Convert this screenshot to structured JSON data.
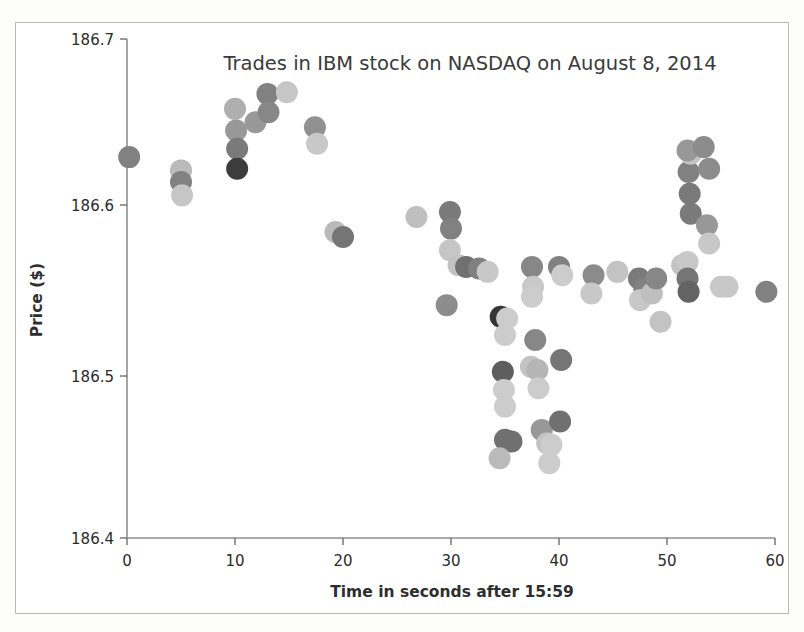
{
  "figure": {
    "title": "Trades in IBM stock on NASDAQ on August 8, 2014",
    "xlabel": "Time in seconds after 15:59",
    "ylabel": "Price ($)"
  },
  "axes": {
    "x_ticks": [
      "0",
      "10",
      "20",
      "30",
      "40",
      "50",
      "60"
    ],
    "y_ticks": [
      "186.4",
      "186.5",
      "186.6",
      "186.7"
    ]
  },
  "chart_data": {
    "type": "scatter",
    "title": "Trades in IBM stock on NASDAQ on August 8, 2014",
    "xlabel": "Time in seconds after 15:59",
    "ylabel": "Price ($)",
    "xlim": [
      0,
      60
    ],
    "ylim": [
      186.4,
      186.7
    ],
    "xtick_values": [
      0,
      10,
      20,
      30,
      40,
      50,
      60
    ],
    "ytick_values": [
      186.4,
      186.5,
      186.6,
      186.7
    ],
    "grid": false,
    "legend": "none",
    "marker": "circle",
    "marker_size_px": 22,
    "note": "Marker gray level varies with trade size / overplotting; darker dots indicate overlapping or larger trades.",
    "points": [
      {
        "x": 0.2,
        "y": 186.629,
        "shade": 0.55
      },
      {
        "x": 5.0,
        "y": 186.621,
        "shade": 0.3
      },
      {
        "x": 5.0,
        "y": 186.614,
        "shade": 0.55
      },
      {
        "x": 5.1,
        "y": 186.606,
        "shade": 0.25
      },
      {
        "x": 10.0,
        "y": 186.658,
        "shade": 0.35
      },
      {
        "x": 10.1,
        "y": 186.645,
        "shade": 0.45
      },
      {
        "x": 10.2,
        "y": 186.634,
        "shade": 0.58
      },
      {
        "x": 10.2,
        "y": 186.622,
        "shade": 0.85
      },
      {
        "x": 11.9,
        "y": 186.65,
        "shade": 0.45
      },
      {
        "x": 13.0,
        "y": 186.667,
        "shade": 0.55
      },
      {
        "x": 13.1,
        "y": 186.656,
        "shade": 0.52
      },
      {
        "x": 14.8,
        "y": 186.668,
        "shade": 0.25
      },
      {
        "x": 17.4,
        "y": 186.647,
        "shade": 0.48
      },
      {
        "x": 17.6,
        "y": 186.637,
        "shade": 0.24
      },
      {
        "x": 19.3,
        "y": 186.584,
        "shade": 0.3
      },
      {
        "x": 20.0,
        "y": 186.581,
        "shade": 0.6
      },
      {
        "x": 26.8,
        "y": 186.593,
        "shade": 0.28
      },
      {
        "x": 29.9,
        "y": 186.596,
        "shade": 0.58
      },
      {
        "x": 30.0,
        "y": 186.586,
        "shade": 0.55
      },
      {
        "x": 29.9,
        "y": 186.573,
        "shade": 0.25
      },
      {
        "x": 30.7,
        "y": 186.564,
        "shade": 0.26
      },
      {
        "x": 31.4,
        "y": 186.563,
        "shade": 0.62
      },
      {
        "x": 29.6,
        "y": 186.54,
        "shade": 0.5
      },
      {
        "x": 32.6,
        "y": 186.562,
        "shade": 0.55
      },
      {
        "x": 33.4,
        "y": 186.56,
        "shade": 0.24
      },
      {
        "x": 34.6,
        "y": 186.533,
        "shade": 0.88
      },
      {
        "x": 35.2,
        "y": 186.532,
        "shade": 0.22
      },
      {
        "x": 35.0,
        "y": 186.522,
        "shade": 0.22
      },
      {
        "x": 34.8,
        "y": 186.5,
        "shade": 0.7
      },
      {
        "x": 34.9,
        "y": 186.489,
        "shade": 0.22
      },
      {
        "x": 35.0,
        "y": 186.479,
        "shade": 0.22
      },
      {
        "x": 35.0,
        "y": 186.459,
        "shade": 0.62
      },
      {
        "x": 35.6,
        "y": 186.458,
        "shade": 0.62
      },
      {
        "x": 34.5,
        "y": 186.448,
        "shade": 0.3
      },
      {
        "x": 37.5,
        "y": 186.563,
        "shade": 0.52
      },
      {
        "x": 37.6,
        "y": 186.551,
        "shade": 0.24
      },
      {
        "x": 37.5,
        "y": 186.545,
        "shade": 0.22
      },
      {
        "x": 37.8,
        "y": 186.519,
        "shade": 0.52
      },
      {
        "x": 37.4,
        "y": 186.503,
        "shade": 0.26
      },
      {
        "x": 38.0,
        "y": 186.501,
        "shade": 0.32
      },
      {
        "x": 38.1,
        "y": 186.49,
        "shade": 0.22
      },
      {
        "x": 38.4,
        "y": 186.465,
        "shade": 0.45
      },
      {
        "x": 38.9,
        "y": 186.457,
        "shade": 0.26
      },
      {
        "x": 39.3,
        "y": 186.456,
        "shade": 0.22
      },
      {
        "x": 39.1,
        "y": 186.445,
        "shade": 0.22
      },
      {
        "x": 40.0,
        "y": 186.563,
        "shade": 0.55
      },
      {
        "x": 40.3,
        "y": 186.558,
        "shade": 0.22
      },
      {
        "x": 40.2,
        "y": 186.507,
        "shade": 0.6
      },
      {
        "x": 40.1,
        "y": 186.47,
        "shade": 0.62
      },
      {
        "x": 43.2,
        "y": 186.558,
        "shade": 0.5
      },
      {
        "x": 43.0,
        "y": 186.547,
        "shade": 0.24
      },
      {
        "x": 45.4,
        "y": 186.56,
        "shade": 0.26
      },
      {
        "x": 47.4,
        "y": 186.556,
        "shade": 0.58
      },
      {
        "x": 47.9,
        "y": 186.55,
        "shade": 0.55
      },
      {
        "x": 47.5,
        "y": 186.543,
        "shade": 0.24
      },
      {
        "x": 48.6,
        "y": 186.547,
        "shade": 0.28
      },
      {
        "x": 49.0,
        "y": 186.556,
        "shade": 0.52
      },
      {
        "x": 49.4,
        "y": 186.53,
        "shade": 0.26
      },
      {
        "x": 51.4,
        "y": 186.564,
        "shade": 0.26
      },
      {
        "x": 51.9,
        "y": 186.566,
        "shade": 0.24
      },
      {
        "x": 51.9,
        "y": 186.556,
        "shade": 0.6
      },
      {
        "x": 52.0,
        "y": 186.548,
        "shade": 0.68
      },
      {
        "x": 52.2,
        "y": 186.595,
        "shade": 0.58
      },
      {
        "x": 52.1,
        "y": 186.607,
        "shade": 0.58
      },
      {
        "x": 52.0,
        "y": 186.62,
        "shade": 0.55
      },
      {
        "x": 52.2,
        "y": 186.631,
        "shade": 0.26
      },
      {
        "x": 51.9,
        "y": 186.633,
        "shade": 0.45
      },
      {
        "x": 53.4,
        "y": 186.635,
        "shade": 0.5
      },
      {
        "x": 53.9,
        "y": 186.622,
        "shade": 0.5
      },
      {
        "x": 53.7,
        "y": 186.588,
        "shade": 0.45
      },
      {
        "x": 53.9,
        "y": 186.577,
        "shade": 0.24
      },
      {
        "x": 55.0,
        "y": 186.551,
        "shade": 0.24
      },
      {
        "x": 55.6,
        "y": 186.551,
        "shade": 0.24
      },
      {
        "x": 59.2,
        "y": 186.548,
        "shade": 0.55
      }
    ]
  }
}
